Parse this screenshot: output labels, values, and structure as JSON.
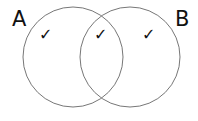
{
  "diagram": {
    "type": "venn",
    "sets": [
      {
        "id": "A",
        "label": "A",
        "cx": 73,
        "cy": 57,
        "r": 50
      },
      {
        "id": "B",
        "label": "B",
        "cx": 130,
        "cy": 57,
        "r": 50
      }
    ],
    "marks": {
      "a_only": "✓",
      "intersection": "✓",
      "b_only": "✓"
    },
    "colors": {
      "stroke": "#777777",
      "text": "#111111"
    }
  }
}
